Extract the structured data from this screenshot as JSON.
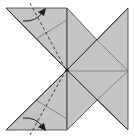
{
  "diagram": {
    "type": "origami-fold-diagram",
    "colors": {
      "background": "#ffffff",
      "paper": "#c4c4c4",
      "crease": "#6e6e6e",
      "edge": "#3a3a3a",
      "valley_fold": "#2a2a2a",
      "arrow": "#1a1a1a"
    },
    "annotations": [
      {
        "kind": "valley-fold-line",
        "label": "upper valley fold"
      },
      {
        "kind": "fold-arrow",
        "label": "upper fold arrow"
      },
      {
        "kind": "valley-fold-line",
        "label": "lower valley fold"
      },
      {
        "kind": "fold-arrow",
        "label": "lower fold arrow"
      }
    ]
  }
}
